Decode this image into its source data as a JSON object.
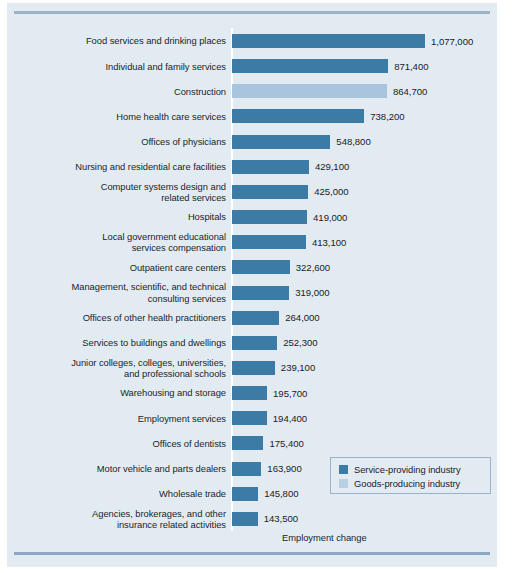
{
  "chart_data": {
    "type": "bar",
    "orientation": "horizontal",
    "title": "",
    "xlabel": "Employment change",
    "ylabel": "",
    "xlim": [
      0,
      1077000
    ],
    "grid": false,
    "legend_position": "bottom-right",
    "categories": [
      "Food services and drinking places",
      "Individual and family services",
      "Construction",
      "Home health care services",
      "Offices of physicians",
      "Nursing and residential care facilities",
      "Computer systems design and\nrelated services",
      "Hospitals",
      "Local government educational\nservices compensation",
      "Outpatient care centers",
      "Management, scientific, and technical\nconsulting services",
      "Offices of other health practitioners",
      "Services to buildings and dwellings",
      "Junior colleges, colleges, universities,\nand professional schools",
      "Warehousing and storage",
      "Employment services",
      "Offices of dentists",
      "Motor vehicle and parts dealers",
      "Wholesale trade",
      "Agencies, brokerages, and other\ninsurance related activities"
    ],
    "values": [
      1077000,
      871400,
      864700,
      738200,
      548800,
      429100,
      425000,
      419000,
      413100,
      322600,
      319000,
      264000,
      252300,
      239100,
      195700,
      194400,
      175400,
      163900,
      145800,
      143500
    ],
    "value_labels": [
      "1,077,000",
      "871,400",
      "864,700",
      "738,200",
      "548,800",
      "429,100",
      "425,000",
      "419,000",
      "413,100",
      "322,600",
      "319,000",
      "264,000",
      "252,300",
      "239,100",
      "195,700",
      "194,400",
      "175,400",
      "163,900",
      "145,800",
      "143,500"
    ],
    "groups": [
      "service",
      "service",
      "goods",
      "service",
      "service",
      "service",
      "service",
      "service",
      "service",
      "service",
      "service",
      "service",
      "service",
      "service",
      "service",
      "service",
      "service",
      "service",
      "service",
      "service"
    ],
    "series": [
      {
        "name": "Service-providing industry",
        "color": "#3b7ba6"
      },
      {
        "name": "Goods-producing industry",
        "color": "#a9c4dd"
      }
    ]
  },
  "legend": {
    "items": [
      {
        "label": "Service-providing industry",
        "color": "#3b7ba6"
      },
      {
        "label": "Goods-producing industry",
        "color": "#b9cfe3"
      }
    ]
  },
  "axis": {
    "x_title": "Employment change"
  },
  "colors": {
    "panel_background": "#e3ebf2",
    "rule": "#9fb3c6",
    "service_bar": "#3b7ba6",
    "goods_bar": "#a9c4dd",
    "text": "#20252b"
  }
}
